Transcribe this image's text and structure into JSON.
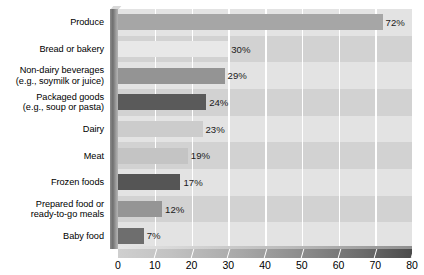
{
  "chart_data": {
    "type": "bar",
    "orientation": "horizontal",
    "title": "",
    "subtitle": "",
    "xlabel": "",
    "ylabel": "",
    "xlim": [
      0,
      80
    ],
    "xticks": [
      "0",
      "10",
      "20",
      "30",
      "40",
      "50",
      "60",
      "70",
      "80"
    ],
    "xtick_values": [
      0,
      10,
      20,
      30,
      40,
      50,
      60,
      70,
      80
    ],
    "grid": "vertical-white-gridlines",
    "legend": "none",
    "value_suffix": "%",
    "categories": [
      "Produce",
      "Bread or bakery",
      "Non-dairy beverages\n(e.g., soymilk or juice)",
      "Packaged goods\n(e.g., soup or pasta)",
      "Dairy",
      "Meat",
      "Frozen foods",
      "Prepared food or\nready-to-go meals",
      "Baby food"
    ],
    "values": [
      72,
      30,
      29,
      24,
      23,
      19,
      17,
      12,
      7
    ],
    "value_labels": [
      "72%",
      "30%",
      "29%",
      "24%",
      "23%",
      "19%",
      "17%",
      "12%",
      "7%"
    ],
    "bar_colors": [
      "#a6a6a6",
      "#e8e8e8",
      "#949494",
      "#5a5a5a",
      "#cccccc",
      "#c4c4c4",
      "#555555",
      "#959595",
      "#6e6e6e"
    ]
  },
  "style": {
    "plot_background": "#d9d9d9",
    "band_light": "#e3e3e3",
    "band_dark": "#d2d2d2",
    "gridline_color": "#ffffff",
    "page_background": "#ffffff",
    "text_color": "#000000"
  }
}
